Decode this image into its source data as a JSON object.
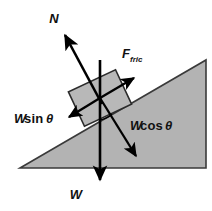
{
  "diagram": {
    "background_color": "#ffffff",
    "incline": {
      "name": "inclined-plane",
      "fill_color": "#b3b3b3",
      "stroke_color": "#3a3a3a",
      "points": "20,168 206,168 206,60",
      "angle_degrees": 30
    },
    "block": {
      "name": "block-on-incline",
      "fill_color": "#b8b8b8",
      "stroke_color": "#2b2b2b",
      "center_x": 100,
      "center_y": 98,
      "width": 52,
      "height": 38,
      "rotation_degrees": -25
    },
    "angle_marker": {
      "name": "theta-angle-arc",
      "symbol": "θ",
      "x": 104,
      "y": 116
    },
    "vectors": [
      {
        "id": "normal-force",
        "label": "N",
        "label_x": 54,
        "label_y": 23,
        "tail_x": 100,
        "tail_y": 98,
        "tip_x": 63,
        "tip_y": 32,
        "color": "#000000",
        "description": "Normal force, perpendicular to incline surface, pointing up-left"
      },
      {
        "id": "friction-force",
        "label": "F",
        "label_subscript": "fric",
        "label_x": 122,
        "label_y": 58,
        "tail_x": 100,
        "tail_y": 98,
        "tip_x": 137,
        "tip_y": 76,
        "color": "#000000",
        "description": "Friction force, parallel to incline, pointing up-slope"
      },
      {
        "id": "weight-component-parallel",
        "label_prefix": "W",
        "label_function": "sin",
        "label_symbol": "θ",
        "label_x": 14,
        "label_y": 123,
        "tail_x": 100,
        "tail_y": 98,
        "tip_x": 67,
        "tip_y": 118,
        "color": "#000000",
        "description": "Component of weight parallel to incline, pointing down-slope"
      },
      {
        "id": "weight-component-perpendicular",
        "label_prefix": "W",
        "label_function": "cos",
        "label_symbol": "θ",
        "label_x": 130,
        "label_y": 130,
        "tail_x": 100,
        "tail_y": 98,
        "tip_x": 138,
        "tip_y": 159,
        "color": "#000000",
        "description": "Component of weight perpendicular to incline, pointing into surface"
      },
      {
        "id": "weight",
        "label": "W",
        "label_x": 76,
        "label_y": 198,
        "tail_x": 100,
        "tail_y": 60,
        "tip_x": 100,
        "tip_y": 182,
        "color": "#000000",
        "description": "Weight vector, straight down"
      }
    ]
  }
}
